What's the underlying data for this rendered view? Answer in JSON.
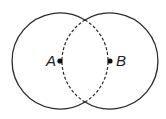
{
  "diagram": {
    "type": "two-intersecting-circles",
    "stroke_color": "#2a2a2a",
    "circles": [
      {
        "name": "circle-a",
        "center_label": "A",
        "cx": 60,
        "cy": 61,
        "r": 48,
        "inner_arc": "dashed"
      },
      {
        "name": "circle-b",
        "center_label": "B",
        "cx": 110,
        "cy": 61,
        "r": 48,
        "inner_arc": "dashed"
      }
    ],
    "points": [
      {
        "label": "A",
        "x": 60,
        "y": 61
      },
      {
        "label": "B",
        "x": 110,
        "y": 61
      }
    ]
  }
}
